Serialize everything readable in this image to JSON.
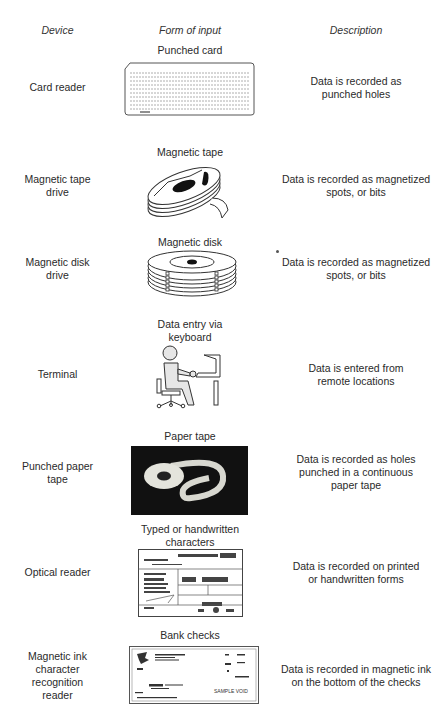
{
  "headers": {
    "device": "Device",
    "form_of_input": "Form of input",
    "description": "Description"
  },
  "rows": [
    {
      "device": [
        "Card reader"
      ],
      "form": [
        "Punched card"
      ],
      "description": [
        "Data is recorded as",
        "punched holes"
      ],
      "image": "punched-card"
    },
    {
      "device": [
        "Magnetic tape",
        "drive"
      ],
      "form": [
        "Magnetic tape"
      ],
      "description": [
        "Data is recorded as magnetized",
        "spots, or bits"
      ],
      "image": "magnetic-tape-reel"
    },
    {
      "device": [
        "Magnetic disk",
        "drive"
      ],
      "form": [
        "Magnetic disk"
      ],
      "description": [
        "Data is recorded as magnetized",
        "spots, or bits"
      ],
      "image": "magnetic-disk-stack"
    },
    {
      "device": [
        "Terminal"
      ],
      "form": [
        "Data entry via",
        "keyboard"
      ],
      "description": [
        "Data is entered from",
        "remote locations"
      ],
      "image": "person-at-terminal"
    },
    {
      "device": [
        "Punched paper",
        "tape"
      ],
      "form": [
        "Paper tape"
      ],
      "description": [
        "Data is recorded as holes",
        "punched in a continuous",
        "paper tape"
      ],
      "image": "paper-tape-roll"
    },
    {
      "device": [
        "Optical reader"
      ],
      "form": [
        "Typed or handwritten",
        "characters"
      ],
      "description": [
        "Data is recorded on printed",
        "or handwritten forms"
      ],
      "image": "printed-form"
    },
    {
      "device": [
        "Magnetic ink",
        "character",
        "recognition",
        "reader"
      ],
      "form": [
        "Bank checks"
      ],
      "description": [
        "Data is recorded in magnetic ink",
        "on the bottom of the checks"
      ],
      "image": "bank-check"
    }
  ],
  "check": {
    "sample_text": "SAMPLE VOID"
  }
}
